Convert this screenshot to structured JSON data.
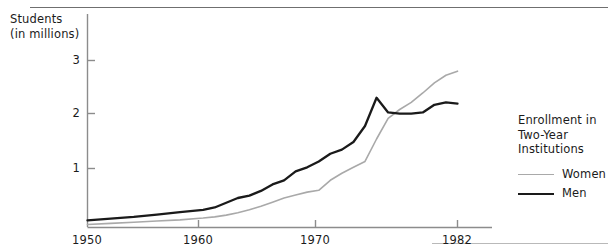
{
  "chart_data": {
    "type": "line",
    "title": "",
    "xlabel": "",
    "ylabel": "Students\n(in millions)",
    "ylabel_line1": "Students",
    "ylabel_line2": "(in millions)",
    "xlim": [
      1950,
      1982
    ],
    "ylim": [
      0,
      3.25
    ],
    "grid": false,
    "legend_position": "right",
    "legend_title": "Enrollment in\nTwo-Year\nInstitutions",
    "legend_title_line1": "Enrollment in",
    "legend_title_line2": "Two-Year",
    "legend_title_line3": "Institutions",
    "y_ticks": [
      1,
      2,
      3
    ],
    "y_tick_labels": [
      "1",
      "2",
      "3"
    ],
    "x_ticks": [
      1950,
      1960,
      1970,
      1982
    ],
    "x_tick_labels": [
      "1950",
      "1960",
      "1970",
      "1982"
    ],
    "colors": {
      "women": "#a9a9a9",
      "men": "#1a1a1a",
      "axis": "#8c8c8c",
      "rule_top": "#6f6f6f",
      "rule_bottom": "#b9b9b9",
      "text": "#1b1b1b"
    },
    "series": [
      {
        "name": "Women",
        "color": "#a9a9a9",
        "x": [
          1950,
          1952,
          1954,
          1956,
          1958,
          1960,
          1961,
          1962,
          1963,
          1964,
          1965,
          1966,
          1967,
          1968,
          1969,
          1970,
          1971,
          1972,
          1973,
          1974,
          1975,
          1976,
          1977,
          1978,
          1979,
          1980,
          1981,
          1982
        ],
        "values": [
          0.05,
          0.07,
          0.09,
          0.11,
          0.13,
          0.16,
          0.18,
          0.21,
          0.25,
          0.3,
          0.36,
          0.43,
          0.5,
          0.55,
          0.6,
          0.63,
          0.8,
          0.92,
          1.02,
          1.12,
          1.5,
          1.85,
          2.0,
          2.12,
          2.28,
          2.45,
          2.58,
          2.65
        ]
      },
      {
        "name": "Men",
        "color": "#1a1a1a",
        "x": [
          1950,
          1952,
          1954,
          1956,
          1958,
          1960,
          1961,
          1962,
          1963,
          1964,
          1965,
          1966,
          1967,
          1968,
          1969,
          1970,
          1971,
          1972,
          1973,
          1974,
          1975,
          1976,
          1977,
          1978,
          1979,
          1980,
          1981,
          1982
        ],
        "values": [
          0.12,
          0.15,
          0.18,
          0.22,
          0.26,
          0.3,
          0.34,
          0.42,
          0.5,
          0.54,
          0.62,
          0.73,
          0.8,
          0.95,
          1.02,
          1.12,
          1.25,
          1.32,
          1.45,
          1.72,
          2.2,
          1.95,
          1.93,
          1.93,
          1.95,
          2.08,
          2.12,
          2.1
        ]
      }
    ],
    "annotations": {
      "men_peak_year": 1975,
      "men_peak_value": 2.2,
      "crossover_year": 1977
    }
  }
}
